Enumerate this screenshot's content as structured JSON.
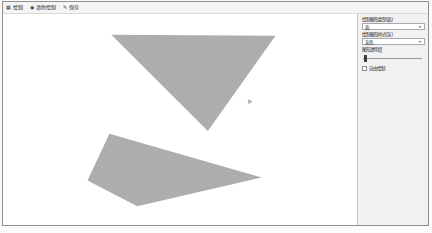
{
  "toolbar": {
    "items": [
      {
        "icon": "grid-icon",
        "label": "绘制"
      },
      {
        "icon": "circle-icon",
        "label": "清除绘制"
      },
      {
        "icon": "pen-icon",
        "label": "保存"
      }
    ]
  },
  "sidebar": {
    "type_select": {
      "label": "绘制图形类型(面)",
      "value": "面"
    },
    "style_select": {
      "label": "绘制图形样式(灰)",
      "value": "灰色"
    },
    "slider": {
      "label": "图形透明度",
      "value_percent": 3
    },
    "freehand_checkbox": {
      "label": "自由绘制",
      "checked": false
    }
  },
  "canvas": {
    "background": "#ffffff",
    "shape_fill": "#adadad",
    "shapes": [
      {
        "name": "triangle-shape",
        "type": "polygon",
        "points": [
          [
            109,
            21
          ],
          [
            274,
            22
          ],
          [
            206,
            118
          ]
        ]
      },
      {
        "name": "quadrilateral-shape",
        "type": "polygon",
        "points": [
          [
            107,
            121
          ],
          [
            260,
            165
          ],
          [
            135,
            194
          ],
          [
            85,
            168
          ]
        ]
      },
      {
        "name": "small-mark",
        "type": "polygon",
        "points": [
          [
            246,
            86
          ],
          [
            251,
            88
          ],
          [
            247,
            91
          ]
        ]
      }
    ]
  },
  "colors": {
    "window_border": "#8f8f8f",
    "toolbar_bg": "#f4f4f4",
    "sidebar_bg": "#f1f1f1",
    "shape_fill": "#adadad"
  }
}
